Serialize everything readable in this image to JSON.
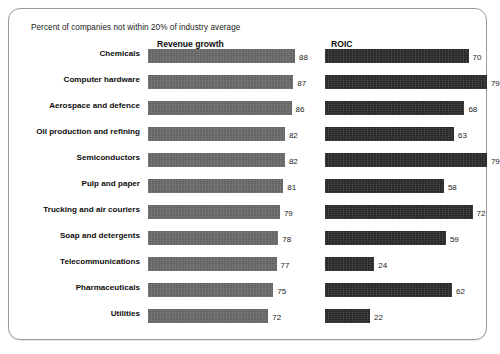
{
  "subtitle": "Percent of companies not within 20% of industry average",
  "columns": {
    "revenue_header": "Revenue growth",
    "roic_header": "ROIC"
  },
  "colors": {
    "revenue_bar": "#6b6b6b",
    "roic_bar": "#2b2b2b",
    "frame_border": "#9a9a9a",
    "text": "#0d0d0d",
    "background": "#ffffff"
  },
  "chart_data": {
    "type": "bar",
    "title": "",
    "subtitle": "Percent of companies not within 20% of industry average",
    "orientation": "horizontal",
    "xlabel": "",
    "ylabel": "",
    "xlim": [
      0,
      100
    ],
    "grid": false,
    "legend": "column-headers",
    "categories": [
      "Chemicals",
      "Computer hardware",
      "Aerospace and defence",
      "Oil production and refining",
      "Semiconductors",
      "Pulp and paper",
      "Trucking and air couriers",
      "Soap and detergents",
      "Telecommunications",
      "Pharmaceuticals",
      "Utilities"
    ],
    "series": [
      {
        "name": "Revenue growth",
        "values": [
          88,
          87,
          86,
          82,
          82,
          81,
          79,
          78,
          77,
          75,
          72
        ]
      },
      {
        "name": "ROIC",
        "values": [
          70,
          79,
          68,
          63,
          79,
          58,
          72,
          59,
          24,
          62,
          22
        ]
      }
    ]
  },
  "rows": [
    {
      "label": "Chemicals",
      "revenue": 88,
      "roic": 70
    },
    {
      "label": "Computer hardware",
      "revenue": 87,
      "roic": 79
    },
    {
      "label": "Aerospace and defence",
      "revenue": 86,
      "roic": 68
    },
    {
      "label": "Oil production and refining",
      "revenue": 82,
      "roic": 63
    },
    {
      "label": "Semiconductors",
      "revenue": 82,
      "roic": 79
    },
    {
      "label": "Pulp and paper",
      "revenue": 81,
      "roic": 58
    },
    {
      "label": "Trucking and air couriers",
      "revenue": 79,
      "roic": 72
    },
    {
      "label": "Soap and detergents",
      "revenue": 78,
      "roic": 59
    },
    {
      "label": "Telecommunications",
      "revenue": 77,
      "roic": 24
    },
    {
      "label": "Pharmaceuticals",
      "revenue": 75,
      "roic": 62
    },
    {
      "label": "Utilities",
      "revenue": 72,
      "roic": 22
    }
  ],
  "scale": {
    "revenue_px_per_unit": 1.67,
    "roic_px_per_unit": 2.05
  }
}
